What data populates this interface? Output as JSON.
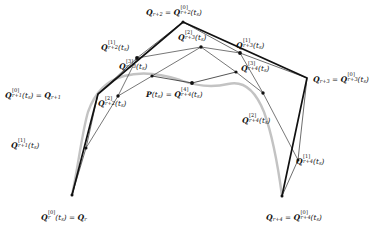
{
  "figure": {
    "type": "geometric-diagram",
    "width": 386,
    "height": 235,
    "background_color": "#ffffff",
    "ink_color": "#111111",
    "curve_color": "#b9b9b9",
    "thin_color": "#4a4a4a"
  },
  "labels": {
    "q_r": {
      "text": "Q_r^{[0]}(t_s) = Q_r",
      "base": "Q",
      "sub": "r",
      "sup": "[0]",
      "arg": "(t",
      "arg_sub": "s",
      "arg_end": ")",
      "eq": "=",
      "rhs_base": "Q",
      "rhs_sub": "r"
    },
    "q_r1_0": {
      "base": "Q",
      "sub": "r+1",
      "sup": "[0]",
      "rhs_sub": "r+1"
    },
    "q_r1_1": {
      "base": "Q",
      "sub": "r+1",
      "sup": "[1]"
    },
    "q_r2_0": {
      "base": "Q",
      "sub": "r+2",
      "sup": "[0]",
      "lhs_sub": "r+2"
    },
    "q_r2_1": {
      "base": "Q",
      "sub": "r+2",
      "sup": "[1]"
    },
    "q_r2_2": {
      "base": "Q",
      "sub": "r+2",
      "sup": "[2]"
    },
    "q_r3_0": {
      "base": "Q",
      "sub": "r+3",
      "sup": "[0]",
      "lhs_sub": "r+3"
    },
    "q_r3_1": {
      "base": "Q",
      "sub": "r+3",
      "sup": "[1]"
    },
    "q_r3_2": {
      "base": "Q",
      "sub": "r+3",
      "sup": "[2]"
    },
    "q_r3_3": {
      "base": "Q",
      "sub": "r+3",
      "sup": "[3]"
    },
    "q_r4_0": {
      "base": "Q",
      "sub": "r+4",
      "sup": "[0]",
      "lhs_sub": "r+4"
    },
    "q_r4_1": {
      "base": "Q",
      "sub": "r+4",
      "sup": "[1]"
    },
    "q_r4_2": {
      "base": "Q",
      "sub": "r+4",
      "sup": "[2]"
    },
    "q_r4_3": {
      "base": "Q",
      "sub": "r+4",
      "sup": "[3]"
    },
    "p_ts": {
      "base": "P",
      "arg": "(t",
      "arg_sub": "s",
      "arg_end": ")",
      "eq": "=",
      "rhs_base": "Q",
      "rhs_sub": "r+4",
      "rhs_sup": "[4]"
    },
    "parameter": "t",
    "parameter_sub": "s"
  },
  "points": {
    "Q_r": {
      "x": 72,
      "y": 195,
      "level": 0,
      "label_pos": "below-left"
    },
    "Q_r1": {
      "x": 98,
      "y": 94,
      "level": 0,
      "label_pos": "left"
    },
    "Q_r2": {
      "x": 183,
      "y": 22,
      "level": 0,
      "label_pos": "above"
    },
    "Q_r3": {
      "x": 307,
      "y": 78,
      "level": 0,
      "label_pos": "right"
    },
    "Q_r4": {
      "x": 282,
      "y": 196,
      "level": 0,
      "label_pos": "below-right"
    },
    "Q_r1_1": {
      "x": 86,
      "y": 148,
      "level": 1,
      "label_pos": "left"
    },
    "Q_r2_1": {
      "x": 137,
      "y": 58,
      "level": 1,
      "label_pos": "above-left"
    },
    "Q_r3_1": {
      "x": 240,
      "y": 53,
      "level": 1,
      "label_pos": "above"
    },
    "Q_r4_1": {
      "x": 298,
      "y": 160,
      "level": 1,
      "label_pos": "right"
    },
    "Q_r2_2": {
      "x": 118,
      "y": 96,
      "level": 2,
      "label_pos": "below-left"
    },
    "Q_r3_2": {
      "x": 201,
      "y": 47,
      "level": 2,
      "label_pos": "above"
    },
    "Q_r4_2": {
      "x": 263,
      "y": 93,
      "level": 2,
      "label_pos": "right"
    },
    "Q_r3_3": {
      "x": 152,
      "y": 76,
      "level": 3,
      "label_pos": "above-left"
    },
    "Q_r4_3": {
      "x": 236,
      "y": 72,
      "level": 3,
      "label_pos": "right"
    },
    "P_ts": {
      "x": 192,
      "y": 83,
      "level": 4,
      "label_pos": "below-left"
    }
  },
  "polygon": {
    "name": "control-polygon",
    "vertices": [
      "Q_r",
      "Q_r1",
      "Q_r2",
      "Q_r3",
      "Q_r4"
    ],
    "stroke_width": 1.6
  },
  "curve": {
    "name": "b-spline-curve",
    "stroke_width": 2.2,
    "color": "#c0c0c0"
  },
  "levels": [
    {
      "level": 1,
      "chords": [
        [
          "Q_r",
          "Q_r1_1"
        ],
        [
          "Q_r1_1",
          "Q_r1"
        ],
        [
          "Q_r1",
          "Q_r2_1"
        ],
        [
          "Q_r2_1",
          "Q_r2"
        ],
        [
          "Q_r2",
          "Q_r3_1"
        ],
        [
          "Q_r3_1",
          "Q_r3"
        ],
        [
          "Q_r3",
          "Q_r4_1"
        ],
        [
          "Q_r4_1",
          "Q_r4"
        ]
      ]
    },
    {
      "level": 2,
      "chords": [
        [
          "Q_r1_1",
          "Q_r2_2"
        ],
        [
          "Q_r2_2",
          "Q_r2_1"
        ],
        [
          "Q_r2_1",
          "Q_r3_2"
        ],
        [
          "Q_r3_2",
          "Q_r3_1"
        ],
        [
          "Q_r3_1",
          "Q_r4_2"
        ],
        [
          "Q_r4_2",
          "Q_r4_1"
        ]
      ]
    },
    {
      "level": 3,
      "chords": [
        [
          "Q_r2_2",
          "Q_r3_3"
        ],
        [
          "Q_r3_3",
          "Q_r3_2"
        ],
        [
          "Q_r3_2",
          "Q_r4_3"
        ],
        [
          "Q_r4_3",
          "Q_r4_2"
        ]
      ]
    },
    {
      "level": 4,
      "chords": [
        [
          "Q_r3_3",
          "P_ts"
        ],
        [
          "P_ts",
          "Q_r4_3"
        ]
      ]
    }
  ]
}
